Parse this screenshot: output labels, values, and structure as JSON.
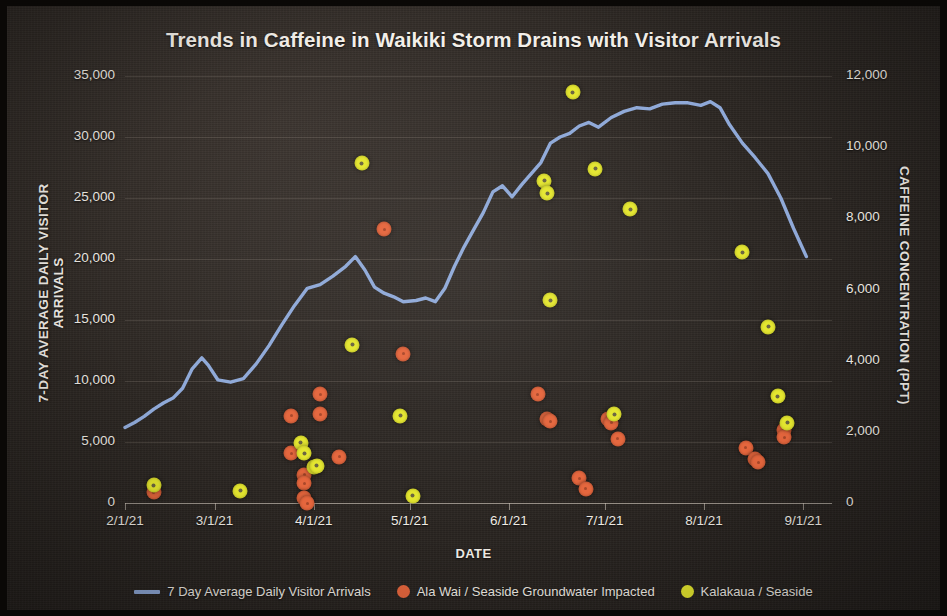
{
  "chart_data": {
    "type": "line",
    "title": "Trends in Caffeine in Waikiki Storm Drains with Visitor Arrivals",
    "xlabel": "DATE",
    "ylabel": "7-DAY AVERAGE DAILY VISITOR ARRIVALS",
    "y2label": "CAFFEINE CONCENTRATION (PPT)",
    "grid": true,
    "legend_position": "bottom",
    "xlim": [
      "2021-02-01",
      "2021-09-10"
    ],
    "ylim": [
      0,
      35000
    ],
    "y2lim": [
      0,
      12000
    ],
    "xticks": [
      "2/1/21",
      "3/1/21",
      "4/1/21",
      "5/1/21",
      "6/1/21",
      "7/1/21",
      "8/1/21",
      "9/1/21"
    ],
    "yticks": [
      "0",
      "5,000",
      "10,000",
      "15,000",
      "20,000",
      "25,000",
      "30,000",
      "35,000"
    ],
    "y2ticks": [
      "0",
      "2,000",
      "4,000",
      "6,000",
      "8,000",
      "10,000",
      "12,000"
    ],
    "colors": {
      "line": "#8fa9d8",
      "ala_wai": "#e5663d",
      "kalakaua": "#e4e62f",
      "background": "#2b2622",
      "text": "#f2eee8",
      "grid": "#bdb4a8"
    },
    "series": [
      {
        "name": "7 Day Average Daily Visitor Arrivals",
        "type": "line",
        "axis": "left",
        "unit": "visitors",
        "points": [
          {
            "date": "2/1/21",
            "value": 6200
          },
          {
            "date": "2/4/21",
            "value": 6600
          },
          {
            "date": "2/7/21",
            "value": 7100
          },
          {
            "date": "2/10/21",
            "value": 7700
          },
          {
            "date": "2/13/21",
            "value": 8200
          },
          {
            "date": "2/16/21",
            "value": 8600
          },
          {
            "date": "2/19/21",
            "value": 9400
          },
          {
            "date": "2/22/21",
            "value": 11000
          },
          {
            "date": "2/25/21",
            "value": 11900
          },
          {
            "date": "2/27/21",
            "value": 11300
          },
          {
            "date": "3/2/21",
            "value": 10100
          },
          {
            "date": "3/6/21",
            "value": 9900
          },
          {
            "date": "3/10/21",
            "value": 10200
          },
          {
            "date": "3/14/21",
            "value": 11400
          },
          {
            "date": "3/18/21",
            "value": 12900
          },
          {
            "date": "3/22/21",
            "value": 14600
          },
          {
            "date": "3/26/21",
            "value": 16200
          },
          {
            "date": "3/30/21",
            "value": 17600
          },
          {
            "date": "4/3/21",
            "value": 17900
          },
          {
            "date": "4/7/21",
            "value": 18600
          },
          {
            "date": "4/11/21",
            "value": 19400
          },
          {
            "date": "4/14/21",
            "value": 20200
          },
          {
            "date": "4/17/21",
            "value": 19100
          },
          {
            "date": "4/20/21",
            "value": 17700
          },
          {
            "date": "4/23/21",
            "value": 17200
          },
          {
            "date": "4/26/21",
            "value": 16900
          },
          {
            "date": "4/29/21",
            "value": 16500
          },
          {
            "date": "5/3/21",
            "value": 16600
          },
          {
            "date": "5/6/21",
            "value": 16800
          },
          {
            "date": "5/9/21",
            "value": 16500
          },
          {
            "date": "5/12/21",
            "value": 17600
          },
          {
            "date": "5/15/21",
            "value": 19400
          },
          {
            "date": "5/18/21",
            "value": 21000
          },
          {
            "date": "5/21/21",
            "value": 22400
          },
          {
            "date": "5/24/21",
            "value": 23800
          },
          {
            "date": "5/27/21",
            "value": 25500
          },
          {
            "date": "5/30/21",
            "value": 26000
          },
          {
            "date": "6/2/21",
            "value": 25100
          },
          {
            "date": "6/5/21",
            "value": 26100
          },
          {
            "date": "6/8/21",
            "value": 27000
          },
          {
            "date": "6/11/21",
            "value": 27900
          },
          {
            "date": "6/14/21",
            "value": 29500
          },
          {
            "date": "6/17/21",
            "value": 30000
          },
          {
            "date": "6/20/21",
            "value": 30300
          },
          {
            "date": "6/23/21",
            "value": 30900
          },
          {
            "date": "6/26/21",
            "value": 31200
          },
          {
            "date": "6/29/21",
            "value": 30800
          },
          {
            "date": "7/3/21",
            "value": 31600
          },
          {
            "date": "7/7/21",
            "value": 32100
          },
          {
            "date": "7/11/21",
            "value": 32400
          },
          {
            "date": "7/15/21",
            "value": 32300
          },
          {
            "date": "7/19/21",
            "value": 32700
          },
          {
            "date": "7/23/21",
            "value": 32800
          },
          {
            "date": "7/27/21",
            "value": 32800
          },
          {
            "date": "7/31/21",
            "value": 32600
          },
          {
            "date": "8/3/21",
            "value": 32900
          },
          {
            "date": "8/6/21",
            "value": 32400
          },
          {
            "date": "8/9/21",
            "value": 31000
          },
          {
            "date": "8/13/21",
            "value": 29500
          },
          {
            "date": "8/17/21",
            "value": 28300
          },
          {
            "date": "8/21/21",
            "value": 27000
          },
          {
            "date": "8/25/21",
            "value": 25000
          },
          {
            "date": "8/29/21",
            "value": 22500
          },
          {
            "date": "9/2/21",
            "value": 20200
          }
        ]
      },
      {
        "name": "Ala Wai / Seaside Groundwater Impacted",
        "type": "scatter",
        "axis": "right",
        "unit": "PPT",
        "points": [
          {
            "date": "2/10/21",
            "value": 300
          },
          {
            "date": "3/25/21",
            "value": 2450
          },
          {
            "date": "3/25/21",
            "value": 1400
          },
          {
            "date": "3/29/21",
            "value": 800
          },
          {
            "date": "3/29/21",
            "value": 550
          },
          {
            "date": "3/29/21",
            "value": 150
          },
          {
            "date": "3/30/21",
            "value": 0
          },
          {
            "date": "4/3/21",
            "value": 3050
          },
          {
            "date": "4/3/21",
            "value": 2500
          },
          {
            "date": "4/9/21",
            "value": 1300
          },
          {
            "date": "4/23/21",
            "value": 7700
          },
          {
            "date": "4/29/21",
            "value": 4200
          },
          {
            "date": "6/10/21",
            "value": 3050
          },
          {
            "date": "6/13/21",
            "value": 2350
          },
          {
            "date": "6/14/21",
            "value": 2300
          },
          {
            "date": "6/23/21",
            "value": 700
          },
          {
            "date": "6/25/21",
            "value": 400
          },
          {
            "date": "7/2/21",
            "value": 2350
          },
          {
            "date": "7/3/21",
            "value": 2250
          },
          {
            "date": "7/5/21",
            "value": 1800
          },
          {
            "date": "8/14/21",
            "value": 1550
          },
          {
            "date": "8/17/21",
            "value": 1250
          },
          {
            "date": "8/18/21",
            "value": 1150
          },
          {
            "date": "8/26/21",
            "value": 2050
          },
          {
            "date": "8/26/21",
            "value": 1850
          }
        ]
      },
      {
        "name": "Kalakaua / Seaside",
        "type": "scatter",
        "axis": "right",
        "unit": "PPT",
        "points": [
          {
            "date": "2/10/21",
            "value": 500
          },
          {
            "date": "3/9/21",
            "value": 350
          },
          {
            "date": "3/28/21",
            "value": 1700
          },
          {
            "date": "3/29/21",
            "value": 1400
          },
          {
            "date": "4/1/21",
            "value": 1000
          },
          {
            "date": "4/2/21",
            "value": 1050
          },
          {
            "date": "4/13/21",
            "value": 4450
          },
          {
            "date": "4/16/21",
            "value": 9550
          },
          {
            "date": "4/28/21",
            "value": 2450
          },
          {
            "date": "5/2/21",
            "value": 200
          },
          {
            "date": "6/12/21",
            "value": 9050
          },
          {
            "date": "6/13/21",
            "value": 8700
          },
          {
            "date": "6/14/21",
            "value": 5700
          },
          {
            "date": "6/21/21",
            "value": 11550
          },
          {
            "date": "6/28/21",
            "value": 9400
          },
          {
            "date": "7/4/21",
            "value": 2500
          },
          {
            "date": "7/9/21",
            "value": 8250
          },
          {
            "date": "8/13/21",
            "value": 7050
          },
          {
            "date": "8/21/21",
            "value": 4950
          },
          {
            "date": "8/24/21",
            "value": 3000
          },
          {
            "date": "8/27/21",
            "value": 2250
          }
        ]
      }
    ]
  },
  "legend": {
    "items": [
      {
        "label": "7 Day Average Daily Visitor Arrivals",
        "marker": "line",
        "color": "#8fa9d8"
      },
      {
        "label": "Ala Wai / Seaside Groundwater Impacted",
        "marker": "dot",
        "color": "#e5663d"
      },
      {
        "label": "Kalakaua / Seaside",
        "marker": "dot",
        "color": "#e4e62f"
      }
    ]
  }
}
